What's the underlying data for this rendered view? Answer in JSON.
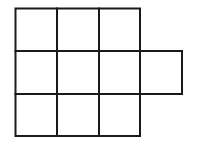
{
  "diagram": {
    "type": "grid-of-squares",
    "stroke_color": "#1a1a1a",
    "background": "#ffffff",
    "rows": 3,
    "cols": 3,
    "extra_cell": {
      "row": 2,
      "col": 4
    },
    "total_cells": 10
  }
}
